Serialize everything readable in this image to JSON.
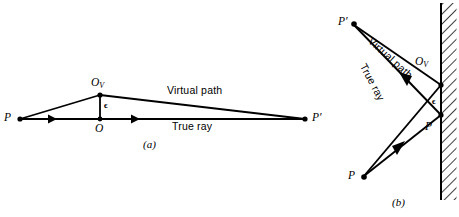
{
  "figure": {
    "background_color": "#ffffff",
    "ink_color": "#000000",
    "panel_a": {
      "caption": "(a)",
      "points": [
        {
          "name": "P",
          "label": "P",
          "sub": "",
          "x": 20,
          "y": 119
        },
        {
          "name": "O_V",
          "label": "O",
          "sub": "V",
          "x": 100,
          "y": 95
        },
        {
          "name": "O",
          "label": "O",
          "sub": "",
          "x": 100,
          "y": 119
        },
        {
          "name": "P_prime",
          "label": "P′",
          "sub": "",
          "x": 305,
          "y": 119
        }
      ],
      "annotations": {
        "virtual_path": "Virtual path",
        "true_ray": "True ray",
        "epsilon": "ϵ"
      }
    },
    "panel_b": {
      "caption": "(b)",
      "mirror": {
        "x": 441,
        "y_top": 3,
        "y_bottom": 200,
        "hatch_width": 15
      },
      "points": [
        {
          "name": "P_prime",
          "label": "P′",
          "sub": "",
          "x": 352,
          "y": 23
        },
        {
          "name": "O_V",
          "label": "O",
          "sub": "V",
          "x": 441,
          "y": 85
        },
        {
          "name": "O",
          "label": "O",
          "sub": "",
          "x": 441,
          "y": 115
        },
        {
          "name": "P",
          "label": "P",
          "sub": "",
          "x": 362,
          "y": 178
        }
      ],
      "annotations": {
        "virtual_path": "Virtual path",
        "true_ray": "True ray",
        "epsilon": "ϵ"
      }
    }
  }
}
